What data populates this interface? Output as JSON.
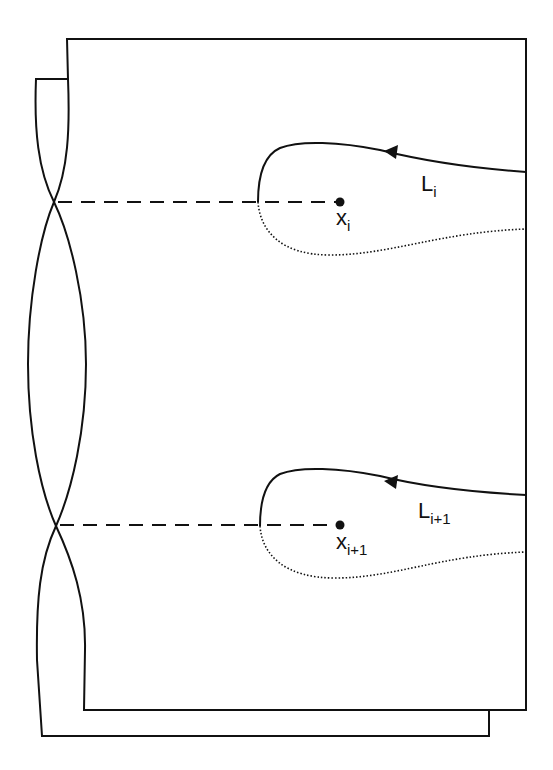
{
  "diagram": {
    "colors": {
      "stroke": "#111111",
      "background": "#ffffff"
    },
    "labels": {
      "loop_top": {
        "base": "L",
        "sub": "i"
      },
      "point_top": {
        "base": "x",
        "sub": "i"
      },
      "loop_bottom": {
        "base": "L",
        "sub": "i+1"
      },
      "point_bottom": {
        "base": "x",
        "sub": "i+1"
      }
    }
  }
}
